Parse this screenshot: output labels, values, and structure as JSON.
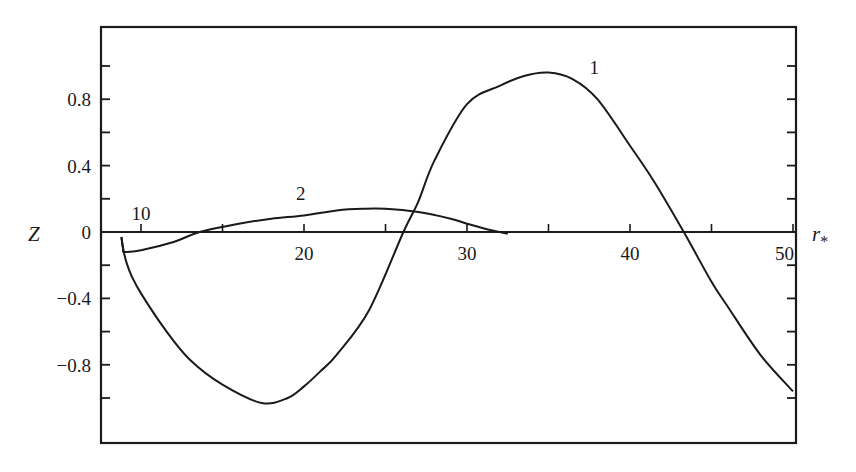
{
  "chart_data": {
    "type": "line",
    "title": "",
    "xlabel": "r*",
    "ylabel": "Z",
    "xlim": [
      7.6,
      50
    ],
    "ylim": [
      -1.27,
      1.24
    ],
    "grid": false,
    "legend": "none (curves labeled inline)",
    "x_ticks": [
      10,
      15,
      20,
      25,
      30,
      35,
      40,
      45,
      50
    ],
    "x_tick_labels": [
      "10",
      "20",
      "30",
      "40",
      "50"
    ],
    "x_tick_label_values": [
      10,
      20,
      30,
      40,
      50
    ],
    "y_ticks": [
      -1.0,
      -0.8,
      -0.6,
      -0.4,
      -0.2,
      0,
      0.2,
      0.4,
      0.6,
      0.8,
      1.0
    ],
    "y_tick_labels": [
      "0.8",
      "0.4",
      "0",
      "−0.4",
      "−0.8"
    ],
    "y_tick_label_values": [
      0.8,
      0.4,
      0,
      -0.4,
      -0.8
    ],
    "series": [
      {
        "name": "1",
        "label_position": {
          "x": 37.8,
          "y": 0.95
        },
        "x": [
          8.8,
          8.9,
          9.1,
          9.4,
          10.0,
          11.5,
          13.0,
          15.0,
          17.4,
          19.0,
          20.0,
          21.0,
          22.0,
          24.0,
          26.1,
          27.0,
          28.0,
          30.0,
          32.0,
          33.5,
          35.0,
          36.5,
          38.0,
          40.0,
          41.5,
          43.3,
          45.0,
          46.0,
          48.0,
          50.0
        ],
        "y": [
          -0.03,
          -0.1,
          -0.18,
          -0.26,
          -0.37,
          -0.59,
          -0.77,
          -0.92,
          -1.03,
          -1.0,
          -0.93,
          -0.84,
          -0.74,
          -0.47,
          0.0,
          0.18,
          0.43,
          0.77,
          0.88,
          0.94,
          0.96,
          0.92,
          0.8,
          0.52,
          0.3,
          0.0,
          -0.3,
          -0.45,
          -0.74,
          -0.96
        ]
      },
      {
        "name": "2",
        "label_position": {
          "x": 19.8,
          "y": 0.19
        },
        "x": [
          8.8,
          8.9,
          9.0,
          10.0,
          12.0,
          13.6,
          16.0,
          18.0,
          20.0,
          22.0,
          23.6,
          25.0,
          27.0,
          29.0,
          30.0,
          31.5,
          32.5
        ],
        "y": [
          -0.03,
          -0.1,
          -0.12,
          -0.11,
          -0.06,
          0.0,
          0.05,
          0.08,
          0.1,
          0.13,
          0.14,
          0.14,
          0.12,
          0.08,
          0.05,
          0.01,
          -0.01
        ]
      }
    ]
  },
  "colors": {
    "ink": "#1a1a1a",
    "background": "#ffffff"
  }
}
